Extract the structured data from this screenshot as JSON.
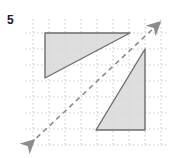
{
  "figure": {
    "problem_number": "5",
    "background_color": "#ffffff"
  },
  "grid": {
    "line_color": "#c9c9c9",
    "style": "dotted",
    "x_start": 33,
    "y_start": 19,
    "cell_size": 16,
    "columns": 8,
    "rows": 8,
    "x_lines": [
      33,
      49,
      65,
      81,
      97,
      113,
      129,
      145,
      161
    ],
    "y_lines": [
      19,
      35,
      51,
      67,
      83,
      99,
      115,
      131,
      147
    ]
  },
  "reflection_line": {
    "label": "line of reflection",
    "style": "dashed",
    "color": "#8c8c8c",
    "stroke_width": 1.6,
    "dash_pattern": "5,4",
    "start": {
      "x": 26,
      "y": 148
    },
    "end": {
      "x": 160,
      "y": 22
    },
    "arrow_start": true,
    "arrow_end": true
  },
  "shapes": [
    {
      "name": "upper-left-triangle",
      "type": "right-triangle",
      "fill": "#d8d8d8",
      "fill_opacity": 0.85,
      "stroke": "#6e6e6e",
      "stroke_width": 1.4,
      "vertices": [
        {
          "x": 45,
          "y": 33
        },
        {
          "x": 130,
          "y": 33
        },
        {
          "x": 45,
          "y": 78
        }
      ],
      "right_angle_at": {
        "x": 45,
        "y": 33
      }
    },
    {
      "name": "lower-right-triangle",
      "type": "right-triangle",
      "fill": "#d8d8d8",
      "fill_opacity": 0.85,
      "stroke": "#6e6e6e",
      "stroke_width": 1.4,
      "vertices": [
        {
          "x": 96,
          "y": 130
        },
        {
          "x": 145,
          "y": 130
        },
        {
          "x": 145,
          "y": 49
        }
      ],
      "right_angle_at": {
        "x": 145,
        "y": 130
      }
    }
  ],
  "colors": {
    "shape_fill": "#d8d8d8",
    "shape_stroke": "#6e6e6e",
    "grid": "#c9c9c9",
    "dashed_line": "#8c8c8c",
    "label_text": "#1a1a1a"
  }
}
